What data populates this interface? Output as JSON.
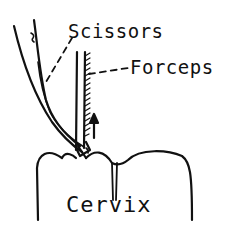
{
  "diagram": {
    "title": "",
    "labels": {
      "scissors": "Scissors",
      "forceps": "Forceps",
      "cervix": "Cervix"
    },
    "elements": [
      {
        "name": "scissors",
        "type": "instrument",
        "label": "Scissors"
      },
      {
        "name": "forceps",
        "type": "instrument",
        "label": "Forceps"
      },
      {
        "name": "cervix",
        "type": "anatomy",
        "label": "Cervix"
      },
      {
        "name": "upward-arrow",
        "type": "arrow",
        "direction": "up"
      }
    ],
    "colors": {
      "ink": "#111111",
      "background": "#ffffff"
    }
  }
}
